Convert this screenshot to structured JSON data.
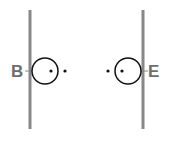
{
  "diagram": {
    "left": {
      "label": "B",
      "line_x": 30,
      "circle": {
        "cx": 45,
        "cy": 71,
        "r": 13
      },
      "dots": [
        {
          "x": 51,
          "y": 71
        },
        {
          "x": 65,
          "y": 71
        }
      ]
    },
    "right": {
      "label": "E",
      "line_x": 143,
      "circle": {
        "cx": 128,
        "cy": 71,
        "r": 13
      },
      "dots": [
        {
          "x": 122,
          "y": 71
        },
        {
          "x": 108,
          "y": 71
        }
      ]
    },
    "colors": {
      "line": "#888888",
      "circle": "#111111",
      "label": "#6e6e6e"
    }
  }
}
